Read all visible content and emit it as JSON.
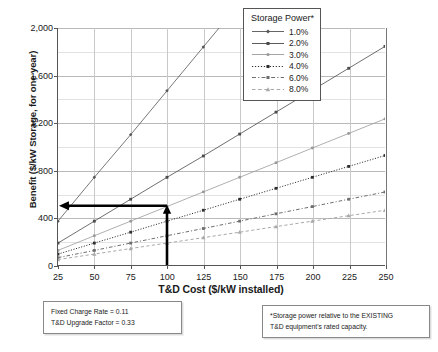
{
  "chart_data": {
    "type": "line",
    "title": "",
    "xlabel": "T&D Cost ($/kW installed)",
    "ylabel": "Benefit ($/kW Storage, for one year)",
    "x": [
      25,
      50,
      75,
      100,
      125,
      150,
      175,
      200,
      225,
      250
    ],
    "xlim": [
      25,
      250
    ],
    "ylim": [
      0,
      2000
    ],
    "yticks": [
      "0",
      "400",
      "800",
      "1,200",
      "1,600",
      "2,000"
    ],
    "ytick_values": [
      0,
      400,
      800,
      1200,
      1600,
      2000
    ],
    "yminor_values": [
      200,
      600,
      1000,
      1400,
      1800
    ],
    "xticks": [
      "25",
      "50",
      "75",
      "100",
      "125",
      "150",
      "175",
      "200",
      "225",
      "250"
    ],
    "grid": true,
    "legend_position": "top-right",
    "legend_title": "Storage Power*",
    "series": [
      {
        "name": "1.0%",
        "color": "#555555",
        "dash": "none",
        "marker": "diamond",
        "values": [
          370,
          740,
          1100,
          1470,
          1840,
          2210,
          2580,
          2950,
          3320,
          3690
        ]
      },
      {
        "name": "2.0%",
        "color": "#4a4a4a",
        "dash": "none",
        "marker": "square",
        "values": [
          185,
          370,
          555,
          740,
          920,
          1105,
          1290,
          1475,
          1660,
          1845
        ]
      },
      {
        "name": "3.0%",
        "color": "#9a9a9a",
        "dash": "none",
        "marker": "circle",
        "values": [
          123,
          247,
          370,
          493,
          617,
          740,
          863,
          987,
          1110,
          1233
        ]
      },
      {
        "name": "4.0%",
        "color": "#2e2e2e",
        "dash": "dotted",
        "marker": "square",
        "values": [
          92,
          185,
          277,
          370,
          462,
          555,
          647,
          740,
          832,
          924
        ]
      },
      {
        "name": "6.0%",
        "color": "#6e6e6e",
        "dash": "dashdot",
        "marker": "square",
        "values": [
          62,
          123,
          185,
          247,
          308,
          370,
          432,
          493,
          555,
          616
        ]
      },
      {
        "name": "8.0%",
        "color": "#a9a9a9",
        "dash": "dashed",
        "marker": "triangle",
        "values": [
          46,
          92,
          139,
          185,
          231,
          277,
          324,
          370,
          416,
          462
        ]
      }
    ],
    "annotation": {
      "name": "reading-guide",
      "x_at": 100,
      "y_at": 500,
      "description": "Bold guide from x = 100 up to benefit ≈ 500 then left to the y-axis"
    }
  },
  "notes": {
    "left": {
      "line1": "Fixed Charge Rate = 0.11",
      "line2": "T&D Upgrade Factor = 0.33"
    },
    "right": {
      "line1": "*Storage power relative to the EXISTING",
      "line2": "T&D equipment's rated capacity."
    }
  }
}
